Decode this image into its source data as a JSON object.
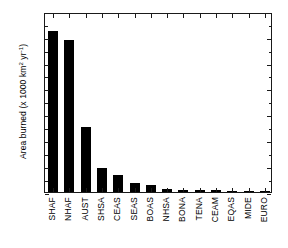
{
  "chart_data": {
    "type": "bar",
    "title": "",
    "xlabel": "",
    "ylabel": "Area burned (x 1000 km2 yr-1)",
    "ylabel_prefix": "Area burned (x 1000 km",
    "ylabel_sup1": "2",
    "ylabel_mid": " yr",
    "ylabel_sup2": "-1",
    "ylabel_suffix": ")",
    "categories": [
      "SHAF",
      "NHAF",
      "AUST",
      "SHSA",
      "CEAS",
      "SEAS",
      "BOAS",
      "NHSA",
      "BONA",
      "TENA",
      "CEAM",
      "EQAS",
      "MIDE",
      "EURO"
    ],
    "values": [
      1245,
      1175,
      500,
      185,
      135,
      67,
      53,
      22,
      19,
      13,
      12,
      10,
      4,
      2
    ],
    "ylim": [
      0,
      1390
    ],
    "yticks": [
      0,
      200,
      400,
      600,
      800,
      1000,
      1200
    ],
    "ytick_labels": [
      "0",
      "200",
      "400",
      "600",
      "800",
      "1000",
      "1200"
    ],
    "yminor_step": 100,
    "grid": false,
    "legend": null,
    "bar_color": "#000000",
    "frame_color": "#1a1a1a",
    "background": "#ffffff"
  }
}
